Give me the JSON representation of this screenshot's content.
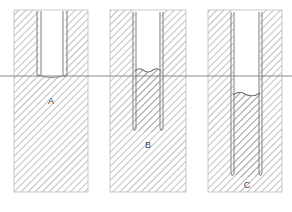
{
  "figure": {
    "width": 292,
    "height": 212,
    "background": "#ffffff",
    "line_color": "#7a7a7a",
    "hatch_color": "#8c8c8c",
    "label_color": "#444444",
    "water_line_y": 76
  },
  "water_line": {
    "name": "water-table-line",
    "y": 76,
    "x_start": 0,
    "x_end": 292,
    "color": "#8a8a8a"
  },
  "panels": [
    {
      "id": "A",
      "label": "A",
      "label_x": 51,
      "label_y": 104,
      "panel_x": 14,
      "panel_width": 74,
      "panel_y": 10,
      "panel_height": 182,
      "tube_left": 39,
      "tube_right": 65,
      "tube_wall": 2,
      "tube_top": 12,
      "tube_bottom": 77,
      "inner_water_y": 76,
      "description": "Wide tube resting at water table"
    },
    {
      "id": "B",
      "label": "B",
      "label_x": 148,
      "label_y": 148,
      "panel_x": 110,
      "panel_width": 76,
      "panel_y": 10,
      "panel_height": 182,
      "tube_left": 133,
      "tube_right": 163,
      "tube_wall": 2,
      "tube_top": 12,
      "tube_bottom": 131,
      "inner_water_y": 72,
      "description": "Medium tube penetrating below water table"
    },
    {
      "id": "C",
      "label": "C",
      "label_x": 247,
      "label_y": 188,
      "panel_x": 208,
      "panel_width": 74,
      "panel_y": 10,
      "panel_height": 182,
      "tube_left": 231,
      "tube_right": 262,
      "tube_wall": 2,
      "tube_top": 12,
      "tube_bottom": 176,
      "inner_water_y": 96,
      "description": "Deep tube with depressed internal water level"
    }
  ]
}
